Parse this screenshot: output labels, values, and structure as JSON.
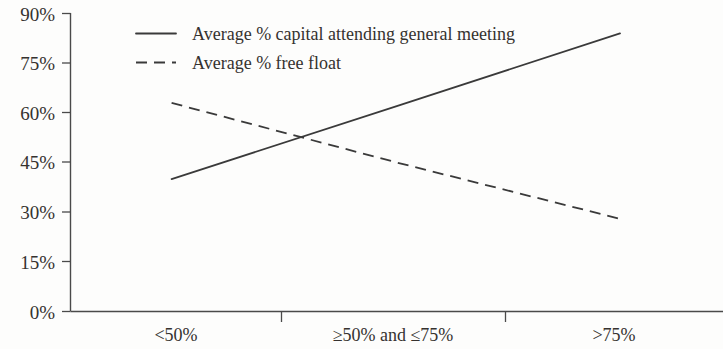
{
  "chart_data": {
    "type": "line",
    "title": "",
    "xlabel": "",
    "ylabel": "",
    "categories": [
      "<50%",
      "≥50% and ≤75%",
      ">75%"
    ],
    "series": [
      {
        "name": "Average % capital attending general meeting",
        "style": "solid",
        "values": [
          40,
          62,
          84
        ]
      },
      {
        "name": "Average % free float",
        "style": "dashed",
        "values": [
          63,
          45,
          28
        ]
      }
    ],
    "ylim": [
      0,
      90
    ],
    "ytick_values": [
      0,
      15,
      30,
      45,
      60,
      75,
      90
    ],
    "ytick_labels": [
      "0%",
      "15%",
      "30%",
      "45%",
      "60%",
      "75%",
      "90%"
    ],
    "grid": false,
    "legend_position": "top-left",
    "line_color": "#3a3a3a",
    "axis_color": "#4a4a4a"
  },
  "legend": {
    "entries": [
      {
        "label": "Average % capital attending general meeting",
        "style": "solid"
      },
      {
        "label": "Average % free float",
        "style": "dashed"
      }
    ]
  }
}
